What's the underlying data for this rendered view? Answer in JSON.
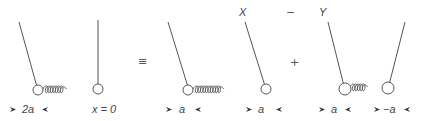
{
  "diagram": {
    "operators": {
      "equiv": "≡",
      "minus": "−",
      "plus": "+"
    },
    "panels": [
      {
        "id": "original",
        "top_label": "",
        "left_label": "2a",
        "right_label": "x = 0",
        "left_arrows": true,
        "right_arrows": false
      },
      {
        "id": "X",
        "top_label": "X",
        "left_label": "a",
        "right_label": "a",
        "left_arrows": true,
        "right_arrows": true
      },
      {
        "id": "Y",
        "top_label": "Y",
        "left_label": "a",
        "right_label": "−a",
        "left_arrows": true,
        "right_arrows": true
      }
    ],
    "colors": {
      "stroke": "#555555",
      "text": "#444444",
      "background": "#ffffff"
    }
  }
}
